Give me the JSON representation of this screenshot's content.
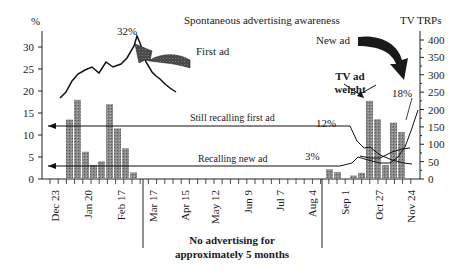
{
  "chart_data": {
    "type": "bar+line",
    "title": "Spontaneous advertising awareness",
    "left_axis": {
      "label": "%",
      "ticks": [
        0,
        5,
        10,
        15,
        20,
        25,
        30
      ],
      "range": [
        0,
        33
      ]
    },
    "right_axis": {
      "label": "TV TRPs",
      "ticks": [
        0,
        50,
        100,
        150,
        200,
        250,
        300,
        350,
        400
      ],
      "range": [
        0,
        420
      ]
    },
    "x_tick_labels": [
      "Dec 23",
      "Jan 20",
      "Feb 17",
      "Mar 17",
      "Apr 15",
      "May 12",
      "Jun 9",
      "Jul 7",
      "Aug 4",
      "Sep 1",
      "Oct 27",
      "Nov 24"
    ],
    "bars_left_campaign_pct": [
      13.5,
      18,
      6.2,
      3.2,
      4,
      17,
      11.5,
      7,
      1.5
    ],
    "bars_right_campaign_trps": [
      28,
      20,
      0,
      10,
      18,
      225,
      172,
      40,
      162,
      135
    ],
    "series": [
      {
        "name": "First ad awareness (%)",
        "values_pct": [
          18,
          20,
          24.5,
          26.5,
          27.5,
          26,
          28.5,
          26.8,
          27.5,
          30,
          32,
          29,
          26,
          23,
          21,
          19,
          17
        ]
      },
      {
        "name": "Still recalling first ad (%)",
        "start_value": 12,
        "end_trend": "declines to ~7"
      },
      {
        "name": "Recalling new ad (%)",
        "start_value": 3,
        "end_value": 18
      }
    ],
    "annotations": [
      {
        "text": "32%",
        "note": "peak of first ad awareness"
      },
      {
        "text": "First ad"
      },
      {
        "text": "New ad"
      },
      {
        "text": "TV ad weight"
      },
      {
        "text": "18%"
      },
      {
        "text": "12%"
      },
      {
        "text": "3%"
      },
      {
        "text": "Still recalling first ad"
      },
      {
        "text": "Recalling new ad"
      },
      {
        "text": "No advertising for approximately 5 months"
      }
    ],
    "grid": false,
    "legend": "none (inline annotations)"
  },
  "labels": {
    "title": "Spontaneous advertising awareness",
    "left_unit": "%",
    "right_unit": "TV TRPs",
    "peak": "32%",
    "first_ad": "First ad",
    "new_ad": "New ad",
    "tv_weight_1": "TV ad",
    "tv_weight_2": "weight",
    "pct18": "18%",
    "pct12": "12%",
    "pct3": "3%",
    "still_recalling": "Still recalling first ad",
    "recalling_new": "Recalling new ad",
    "gap_1": "No advertising for",
    "gap_2": "approximately 5 months"
  },
  "left_ticks": [
    "0",
    "5",
    "10",
    "15",
    "20",
    "25",
    "30"
  ],
  "right_ticks": [
    "0",
    "50",
    "100",
    "150",
    "200",
    "250",
    "300",
    "350",
    "400"
  ],
  "x_ticks": [
    "Dec 23",
    "Jan 20",
    "Feb 17",
    "Mar 17",
    "Apr 15",
    "May 12",
    "Jun 9",
    "Jul 7",
    "Aug 4",
    "Sep 1",
    "Oct 27",
    "Nov 24"
  ]
}
